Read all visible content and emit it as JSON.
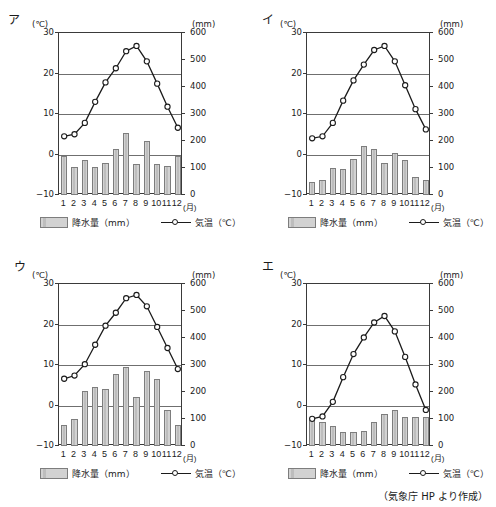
{
  "header": {
    "cut_off_text": "＿＿＿＿　　　　　　　　　　　　　　　　　　　　　　　　　　　　　　"
  },
  "credit": "（気象庁 HP より作成）",
  "legend": {
    "precipitation_label": "降水量（mm）",
    "temperature_label": "気温（℃）",
    "precipitation_icon": "bar-swatch-icon",
    "temperature_icon": "line-marker-icon"
  },
  "axes": {
    "left_unit": "(℃)",
    "right_unit": "(mm)",
    "x_unit": "(月)",
    "left_ticks": [
      "30",
      "20",
      "10",
      "0",
      "-10"
    ],
    "right_ticks": [
      "600",
      "500",
      "400",
      "300",
      "200",
      "100",
      "0"
    ],
    "x_ticks": [
      "1",
      "2",
      "3",
      "4",
      "5",
      "6",
      "7",
      "8",
      "9",
      "10",
      "11",
      "12"
    ]
  },
  "chart_data": [
    {
      "id": "a",
      "panel_label": "ア",
      "type": "bar",
      "title": "",
      "xlabel": "(月)",
      "ylabel": "(℃)",
      "y2label": "(mm)",
      "categories": [
        "1",
        "2",
        "3",
        "4",
        "5",
        "6",
        "7",
        "8",
        "9",
        "10",
        "11",
        "12"
      ],
      "ylim": [
        -10,
        30
      ],
      "y2lim": [
        0,
        600
      ],
      "grid": true,
      "legend_position": "bottom",
      "series": [
        {
          "name": "降水量（mm）",
          "type": "bar",
          "axis": "right",
          "values": [
            145,
            105,
            130,
            102,
            118,
            172,
            228,
            115,
            200,
            113,
            106,
            145
          ]
        },
        {
          "name": "気温（℃）",
          "type": "line",
          "axis": "left",
          "values": [
            4.5,
            5.0,
            7.8,
            13.0,
            17.8,
            21.3,
            25.5,
            26.8,
            23.0,
            17.5,
            11.8,
            6.6
          ]
        }
      ]
    },
    {
      "id": "b",
      "panel_label": "イ",
      "type": "bar",
      "title": "",
      "xlabel": "(月)",
      "ylabel": "(℃)",
      "y2label": "(mm)",
      "categories": [
        "1",
        "2",
        "3",
        "4",
        "5",
        "6",
        "7",
        "8",
        "9",
        "10",
        "11",
        "12"
      ],
      "ylim": [
        -10,
        30
      ],
      "y2lim": [
        0,
        600
      ],
      "grid": true,
      "legend_position": "bottom",
      "series": [
        {
          "name": "降水量（mm）",
          "type": "bar",
          "axis": "right",
          "values": [
            50,
            55,
            100,
            95,
            135,
            183,
            170,
            120,
            157,
            128,
            68,
            54
          ]
        },
        {
          "name": "気温（℃）",
          "type": "line",
          "axis": "left",
          "values": [
            4.0,
            4.5,
            7.8,
            13.3,
            18.3,
            22.2,
            25.8,
            26.8,
            23.0,
            17.1,
            11.2,
            6.2
          ]
        }
      ]
    },
    {
      "id": "c",
      "panel_label": "ウ",
      "type": "bar",
      "title": "",
      "xlabel": "(月)",
      "ylabel": "(℃)",
      "y2label": "(mm)",
      "categories": [
        "1",
        "2",
        "3",
        "4",
        "5",
        "6",
        "7",
        "8",
        "9",
        "10",
        "11",
        "12"
      ],
      "ylim": [
        -10,
        30
      ],
      "y2lim": [
        0,
        600
      ],
      "grid": true,
      "legend_position": "bottom",
      "series": [
        {
          "name": "降水量（mm）",
          "type": "bar",
          "axis": "right",
          "values": [
            78,
            100,
            205,
            218,
            210,
            265,
            292,
            183,
            277,
            248,
            132,
            78
          ]
        },
        {
          "name": "気温（℃）",
          "type": "line",
          "axis": "left",
          "values": [
            6.6,
            7.4,
            10.2,
            15.0,
            19.7,
            22.9,
            26.5,
            27.3,
            24.5,
            19.4,
            14.2,
            9.0
          ]
        }
      ]
    },
    {
      "id": "d",
      "panel_label": "エ",
      "type": "bar",
      "title": "",
      "xlabel": "(月)",
      "ylabel": "(℃)",
      "y2label": "(mm)",
      "categories": [
        "1",
        "2",
        "3",
        "4",
        "5",
        "6",
        "7",
        "8",
        "9",
        "10",
        "11",
        "12"
      ],
      "ylim": [
        -10,
        30
      ],
      "y2lim": [
        0,
        600
      ],
      "grid": true,
      "legend_position": "bottom",
      "series": [
        {
          "name": "降水量（mm）",
          "type": "bar",
          "axis": "right",
          "values": [
            96,
            88,
            75,
            52,
            52,
            57,
            88,
            120,
            135,
            108,
            108,
            108
          ]
        },
        {
          "name": "気温（℃）",
          "type": "line",
          "axis": "left",
          "values": [
            -3.3,
            -2.7,
            0.9,
            7.0,
            12.7,
            16.8,
            20.5,
            22.1,
            18.3,
            12.0,
            5.2,
            -1.1
          ]
        }
      ]
    }
  ],
  "colors": {
    "bar_fill": "#d2d2d2",
    "bar_stroke": "#7d7d7d",
    "line": "#1b1b1b",
    "grid": "#6f6f6f",
    "frame": "#3a3a3a"
  }
}
